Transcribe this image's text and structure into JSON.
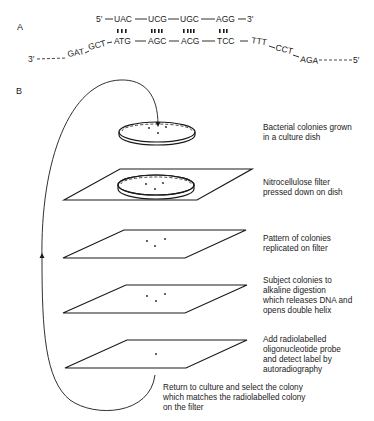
{
  "panels": {
    "a_label": "A",
    "b_label": "B"
  },
  "panel_a": {
    "top_strand": {
      "five_prime": "5′",
      "codons": [
        "UAC",
        "UCG",
        "UGC",
        "AGG"
      ],
      "three_prime": "3′"
    },
    "bottom_strand": {
      "three_prime": "3′",
      "left_flank": [
        "GAT",
        "GCT"
      ],
      "paired": [
        "ATG",
        "AGC",
        "ACG",
        "TCC"
      ],
      "right_flank": [
        "TTT",
        "CCT",
        "AGA"
      ],
      "five_prime": "5′"
    }
  },
  "panel_b": {
    "steps": [
      {
        "text": "Bacterial colonies grown\nin a culture dish",
        "colonies": 3
      },
      {
        "text": "Nitrocellulose filter\npressed down on dish",
        "colonies": 3
      },
      {
        "text": "Pattern of colonies\nreplicated on filter",
        "colonies": 3
      },
      {
        "text": "Subject colonies to\nalkaline digestion\nwhich releases DNA and\nopens double helix",
        "colonies": 3
      },
      {
        "text": "Add radiolabelled\noligonucleotide probe\nand detect label by\nautoradiography",
        "colonies": 1
      }
    ],
    "return_text": "Return to culture and select the colony\nwhich matches the radiolabelled colony\non the filter"
  }
}
